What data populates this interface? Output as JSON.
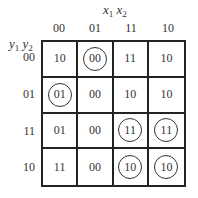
{
  "col_var": {
    "a": "x",
    "a_sub": "1",
    "b": "x",
    "b_sub": "2"
  },
  "row_var": {
    "a": "y",
    "a_sub": "1",
    "b": "y",
    "b_sub": "2"
  },
  "col_headers": [
    "00",
    "01",
    "11",
    "10"
  ],
  "row_headers": [
    "00",
    "01",
    "11",
    "10"
  ],
  "cells": [
    [
      {
        "v": "10",
        "c": false
      },
      {
        "v": "00",
        "c": true
      },
      {
        "v": "11",
        "c": false
      },
      {
        "v": "10",
        "c": false
      }
    ],
    [
      {
        "v": "01",
        "c": true
      },
      {
        "v": "00",
        "c": false
      },
      {
        "v": "10",
        "c": false
      },
      {
        "v": "10",
        "c": false
      }
    ],
    [
      {
        "v": "01",
        "c": false
      },
      {
        "v": "00",
        "c": false
      },
      {
        "v": "11",
        "c": true
      },
      {
        "v": "11",
        "c": true
      }
    ],
    [
      {
        "v": "11",
        "c": false
      },
      {
        "v": "00",
        "c": false
      },
      {
        "v": "10",
        "c": true
      },
      {
        "v": "10",
        "c": true
      }
    ]
  ]
}
